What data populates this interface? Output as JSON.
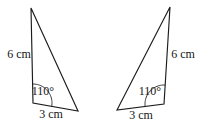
{
  "diagram": {
    "canvas": {
      "width": 216,
      "height": 133,
      "background": "#ffffff"
    },
    "stroke_color": "#1b1b1b",
    "text_color": "#161616",
    "triangles": [
      {
        "id": "left-triangle",
        "vertices": {
          "apex": [
            31,
            8
          ],
          "angle_vertex": [
            33,
            103
          ],
          "base_vertex": [
            78,
            111
          ]
        },
        "angle": {
          "label": "110°",
          "radius": 19,
          "label_pos": [
            43,
            95
          ]
        },
        "side_labels": [
          {
            "text": "6 cm",
            "side": "left",
            "pos": [
              19,
              58
            ]
          },
          {
            "text": "3 cm",
            "side": "bottom",
            "pos": [
              51,
              118
            ]
          }
        ]
      },
      {
        "id": "right-triangle",
        "vertices": {
          "apex": [
            170,
            7
          ],
          "angle_vertex": [
            164,
            104
          ],
          "base_vertex": [
            117,
            110
          ]
        },
        "angle": {
          "label": "110°",
          "radius": 19,
          "label_pos": [
            150,
            95
          ]
        },
        "side_labels": [
          {
            "text": "6 cm",
            "side": "right",
            "pos": [
              183,
              58
            ]
          },
          {
            "text": "3 cm",
            "side": "bottom",
            "pos": [
              141,
              119
            ]
          }
        ]
      }
    ]
  }
}
